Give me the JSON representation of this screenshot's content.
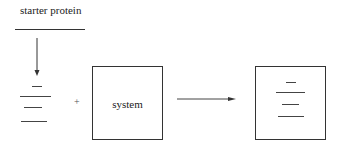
{
  "diagram": {
    "input_label": "starter protein",
    "plus_symbol": "+",
    "system_label": "system",
    "colors": {
      "stroke": "#333333",
      "band": "#444444",
      "background": "#ffffff"
    },
    "input_bands": [
      {
        "x": 32,
        "y": 86,
        "w": 10
      },
      {
        "x": 20,
        "y": 96,
        "w": 31
      },
      {
        "x": 24,
        "y": 107,
        "w": 18
      },
      {
        "x": 21,
        "y": 121,
        "w": 26
      }
    ],
    "output_bands": [
      {
        "x": 286,
        "y": 82,
        "w": 10
      },
      {
        "x": 276,
        "y": 92,
        "w": 29
      },
      {
        "x": 282,
        "y": 104,
        "w": 17
      },
      {
        "x": 278,
        "y": 116,
        "w": 26
      }
    ]
  }
}
